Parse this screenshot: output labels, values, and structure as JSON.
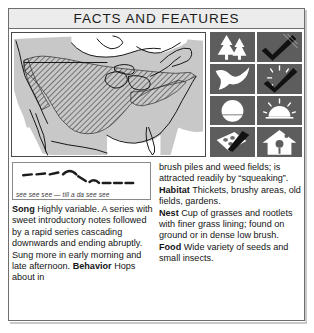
{
  "header": {
    "title": "FACTS AND FEATURES"
  },
  "map": {
    "name": "north-america-range-map",
    "description": "Range map of North America with hatched breeding range",
    "colors": {
      "land": "#c8c8c8",
      "water": "#ffffff",
      "range_hatch": "#4d4d4d",
      "outline": "#1a1a1a"
    }
  },
  "icons": [
    {
      "name": "conifer-trees-icon",
      "label": "Habitat: conifer woodland"
    },
    {
      "name": "checkmark-icon",
      "label": "Confirmed"
    },
    {
      "name": "flying-bird-icon",
      "label": "Bird in flight"
    },
    {
      "name": "checkmark-rays-icon",
      "label": "Confirmed, active"
    },
    {
      "name": "full-circle-icon",
      "label": "Full sun / night"
    },
    {
      "name": "half-sun-rays-icon",
      "label": "Morning / dusk"
    },
    {
      "name": "nest-eggs-icon",
      "label": "Nest with eggs"
    },
    {
      "name": "birdhouse-icon",
      "label": "Nest box"
    }
  ],
  "sonogram": {
    "caption": "see see see — till a da see see"
  },
  "facts": {
    "left": [
      {
        "label": "Song",
        "text": "Highly variable. A series with sweet introductory notes followed by a rapid series cascading downwards and ending abruptly. Sung more in early morning and late afternoon."
      },
      {
        "label": "Behavior",
        "text": "Hops about in"
      }
    ],
    "right_continuation": "brush piles and weed fields; is attracted readily by “squeaking”.",
    "right": [
      {
        "label": "Habitat",
        "text": "Thickets, brushy areas, old fields, gardens."
      },
      {
        "label": "Nest",
        "text": "Cup of grasses and rootlets with finer grass lining; found on ground or in dense low brush."
      },
      {
        "label": "Food",
        "text": "Wide variety of seeds and small insects."
      }
    ]
  }
}
